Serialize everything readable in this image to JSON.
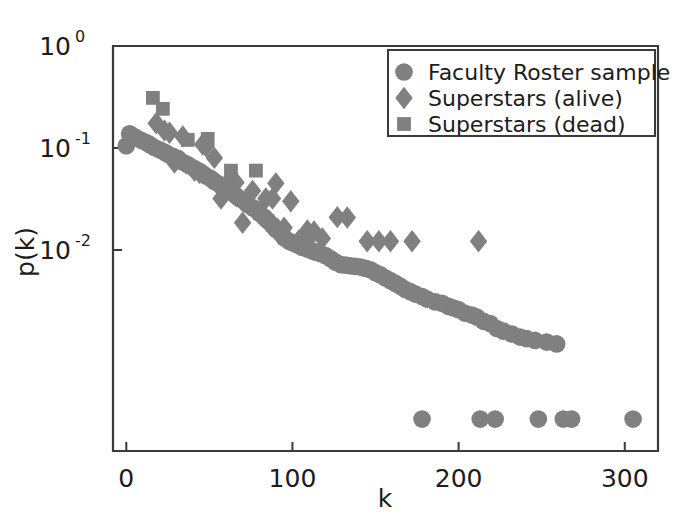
{
  "chart_data": {
    "type": "scatter",
    "title": "",
    "xlabel": "k",
    "ylabel": "p(k)",
    "xscale": "linear",
    "yscale": "log",
    "xlim": [
      -8,
      320
    ],
    "ylim": [
      0.000107,
      1.0
    ],
    "xticks": [
      0,
      100,
      200,
      300
    ],
    "xticklabels": [
      "0",
      "100",
      "200",
      "300"
    ],
    "yticks": [
      1,
      0.1,
      0.01
    ],
    "yticklabels": [
      "10^0",
      "10^-1",
      "10^-2"
    ],
    "ytick_mantissas": [
      "10",
      "10",
      "10"
    ],
    "ytick_exponents": [
      "0",
      "-1",
      "-2"
    ],
    "grid": false,
    "legend_position": "upper right",
    "marker_color": "#808080",
    "axis_color": "#3a3a3a",
    "series": [
      {
        "name": "Faculty Roster sample",
        "marker": "circle",
        "color": "#808080",
        "points": [
          [
            0,
            0.105
          ],
          [
            2,
            0.138
          ],
          [
            4,
            0.131
          ],
          [
            6,
            0.126
          ],
          [
            9,
            0.119
          ],
          [
            12,
            0.113
          ],
          [
            14,
            0.108
          ],
          [
            17,
            0.101
          ],
          [
            20,
            0.096
          ],
          [
            23,
            0.091
          ],
          [
            25,
            0.087
          ],
          [
            28,
            0.083
          ],
          [
            31,
            0.079
          ],
          [
            33,
            0.074
          ],
          [
            36,
            0.07
          ],
          [
            38,
            0.067
          ],
          [
            41,
            0.063
          ],
          [
            44,
            0.059
          ],
          [
            46,
            0.056
          ],
          [
            48,
            0.053
          ],
          [
            51,
            0.05
          ],
          [
            53,
            0.047
          ],
          [
            56,
            0.044
          ],
          [
            58,
            0.041
          ],
          [
            61,
            0.039
          ],
          [
            63,
            0.037
          ],
          [
            66,
            0.034
          ],
          [
            68,
            0.032
          ],
          [
            71,
            0.03
          ],
          [
            73,
            0.028
          ],
          [
            76,
            0.026
          ],
          [
            78,
            0.025
          ],
          [
            80,
            0.023
          ],
          [
            83,
            0.021
          ],
          [
            85,
            0.0195
          ],
          [
            88,
            0.0175
          ],
          [
            90,
            0.016
          ],
          [
            93,
            0.0145
          ],
          [
            95,
            0.0132
          ],
          [
            98,
            0.0122
          ],
          [
            100,
            0.0118
          ],
          [
            103,
            0.0112
          ],
          [
            106,
            0.0106
          ],
          [
            109,
            0.0102
          ],
          [
            112,
            0.0098
          ],
          [
            114,
            0.0095
          ],
          [
            117,
            0.0092
          ],
          [
            120,
            0.0088
          ],
          [
            123,
            0.0082
          ],
          [
            126,
            0.0076
          ],
          [
            129,
            0.0072
          ],
          [
            132,
            0.0071
          ],
          [
            135,
            0.007
          ],
          [
            138,
            0.0069
          ],
          [
            141,
            0.0068
          ],
          [
            144,
            0.0066
          ],
          [
            147,
            0.0064
          ],
          [
            150,
            0.006
          ],
          [
            153,
            0.0057
          ],
          [
            156,
            0.0053
          ],
          [
            159,
            0.005
          ],
          [
            162,
            0.0047
          ],
          [
            165,
            0.0044
          ],
          [
            168,
            0.0041
          ],
          [
            171,
            0.0039
          ],
          [
            174,
            0.0037
          ],
          [
            178,
            0.0035
          ],
          [
            181,
            0.0033
          ],
          [
            186,
            0.0031
          ],
          [
            190,
            0.003
          ],
          [
            194,
            0.0028
          ],
          [
            197,
            0.0027
          ],
          [
            200,
            0.0026
          ],
          [
            204,
            0.0024
          ],
          [
            208,
            0.0023
          ],
          [
            211,
            0.0022
          ],
          [
            215,
            0.002
          ],
          [
            219,
            0.0019
          ],
          [
            223,
            0.0017
          ],
          [
            227,
            0.0016
          ],
          [
            232,
            0.0015
          ],
          [
            237,
            0.0014
          ],
          [
            241,
            0.00135
          ],
          [
            246,
            0.0013
          ],
          [
            253,
            0.00125
          ],
          [
            259,
            0.0012
          ],
          [
            178,
            0.00022
          ],
          [
            213,
            0.00022
          ],
          [
            222,
            0.00022
          ],
          [
            248,
            0.00022
          ],
          [
            263,
            0.00022
          ],
          [
            268,
            0.00022
          ],
          [
            305,
            0.00022
          ]
        ]
      },
      {
        "name": "Superstars (alive)",
        "marker": "diamond",
        "color": "#808080",
        "points": [
          [
            18,
            0.175
          ],
          [
            23,
            0.148
          ],
          [
            26,
            0.141
          ],
          [
            29,
            0.072
          ],
          [
            34,
            0.13
          ],
          [
            46,
            0.108
          ],
          [
            48,
            0.104
          ],
          [
            41,
            0.06
          ],
          [
            44,
            0.057
          ],
          [
            53,
            0.08
          ],
          [
            62,
            0.047
          ],
          [
            66,
            0.046
          ],
          [
            57,
            0.032
          ],
          [
            76,
            0.038
          ],
          [
            90,
            0.045
          ],
          [
            84,
            0.032
          ],
          [
            88,
            0.032
          ],
          [
            99,
            0.03
          ],
          [
            70,
            0.0185
          ],
          [
            95,
            0.0165
          ],
          [
            109,
            0.0155
          ],
          [
            113,
            0.0152
          ],
          [
            104,
            0.0125
          ],
          [
            108,
            0.0122
          ],
          [
            118,
            0.013
          ],
          [
            127,
            0.021
          ],
          [
            133,
            0.0208
          ],
          [
            145,
            0.0122
          ],
          [
            152,
            0.0122
          ],
          [
            159,
            0.0122
          ],
          [
            172,
            0.0122
          ],
          [
            212,
            0.0122
          ]
        ]
      },
      {
        "name": "Superstars (dead)",
        "marker": "square",
        "color": "#808080",
        "points": [
          [
            16,
            0.31
          ],
          [
            22,
            0.242
          ],
          [
            37,
            0.12
          ],
          [
            49,
            0.123
          ],
          [
            63,
            0.06
          ],
          [
            78,
            0.06
          ]
        ]
      }
    ]
  },
  "legend": {
    "entries": [
      {
        "label": "Faculty Roster sample",
        "marker": "circle"
      },
      {
        "label": "Superstars (alive)",
        "marker": "diamond"
      },
      {
        "label": "Superstars (dead)",
        "marker": "square"
      }
    ]
  }
}
